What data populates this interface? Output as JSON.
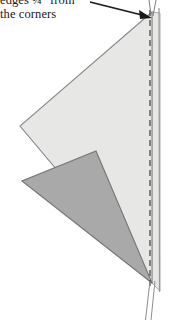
{
  "figure": {
    "annotation": {
      "line1": "edges ¼\" from",
      "line2": "the corners",
      "arrow_label": "arrow-pointing-to-corner"
    },
    "colors": {
      "light_shape_fill": "#e7e7e5",
      "light_shape_stroke": "#8a8a8a",
      "dark_shape_fill": "#a9a9a9",
      "dark_shape_stroke": "#767676",
      "dashed_line": "#4a4a4a",
      "solid_edge": "#9a9a9a",
      "arrow": "#1a1a1a",
      "background": "#ffffff",
      "text": "#1a1a1a"
    },
    "shapes": [
      {
        "name": "light-triangle",
        "role": "upper folded fabric layer",
        "fill": "#e7e7e5",
        "points": "152,12 20,126 152,283"
      },
      {
        "name": "dark-triangle",
        "role": "lower folded fabric layer",
        "fill": "#a9a9a9",
        "points": "22,181 152,283 95,152"
      },
      {
        "name": "right-band",
        "role": "fabric edge strip at right",
        "fill": "#e7e7e5",
        "points": "152,12 160,12 160,290 152,283"
      }
    ],
    "guides": [
      {
        "name": "dashed-seam-line",
        "role": "stitching line",
        "x": 150,
        "y_start": 10,
        "y_end": 286,
        "style": "dashed"
      },
      {
        "name": "solid-edge-line",
        "role": "fabric raw edge",
        "x": 159,
        "y_start": 8,
        "y_end": 292,
        "style": "solid"
      },
      {
        "name": "tail-line-left",
        "role": "thread tail",
        "x1": 150,
        "y1": 283,
        "x2": 146,
        "y2": 320
      },
      {
        "name": "tail-line-right",
        "role": "thread tail",
        "x1": 155,
        "y1": 283,
        "x2": 152,
        "y2": 320
      }
    ],
    "arrow": {
      "name": "callout-arrow",
      "x1": 90,
      "y1": 2,
      "x2": 150,
      "y2": 17
    }
  }
}
